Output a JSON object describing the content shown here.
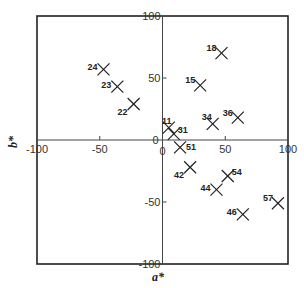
{
  "chart_data": {
    "type": "scatter",
    "title": "",
    "xlabel": "a*",
    "ylabel": "b*",
    "xlim": [
      -100,
      100
    ],
    "ylim": [
      -100,
      100
    ],
    "grid": false,
    "legend": "none",
    "marker": "x",
    "x_ticks": [
      -100,
      -50,
      0,
      50,
      100
    ],
    "y_ticks": [
      -100,
      -50,
      0,
      50,
      100
    ],
    "x_tick_labels": [
      "-100",
      "-50",
      "0",
      "50",
      "100"
    ],
    "y_tick_labels": [
      "-100",
      "-50",
      "0",
      "50",
      "100"
    ],
    "points": [
      {
        "label": "24",
        "a": -47,
        "b": 57,
        "label_pos": "left"
      },
      {
        "label": "23",
        "a": -36,
        "b": 43,
        "label_pos": "left"
      },
      {
        "label": "22",
        "a": -23,
        "b": 29,
        "label_pos": "below-left"
      },
      {
        "label": "18",
        "a": 47,
        "b": 70,
        "label_pos": "upper-left"
      },
      {
        "label": "15",
        "a": 30,
        "b": 44,
        "label_pos": "upper-left"
      },
      {
        "label": "34",
        "a": 40,
        "b": 13,
        "label_pos": "above-left"
      },
      {
        "label": "36",
        "a": 60,
        "b": 18,
        "label_pos": "upper-left"
      },
      {
        "label": "11",
        "a": 5,
        "b": 10,
        "label_pos": "above"
      },
      {
        "label": "31",
        "a": 9,
        "b": 5,
        "label_pos": "upper-right"
      },
      {
        "label": "51",
        "a": 14,
        "b": -6,
        "label_pos": "right"
      },
      {
        "label": "42",
        "a": 22,
        "b": -22,
        "label_pos": "below-left"
      },
      {
        "label": "54",
        "a": 52,
        "b": -29,
        "label_pos": "upper-right"
      },
      {
        "label": "44",
        "a": 43,
        "b": -40,
        "label_pos": "left"
      },
      {
        "label": "57",
        "a": 92,
        "b": -51,
        "label_pos": "upper-left"
      },
      {
        "label": "46",
        "a": 64,
        "b": -60,
        "label_pos": "left"
      }
    ]
  }
}
